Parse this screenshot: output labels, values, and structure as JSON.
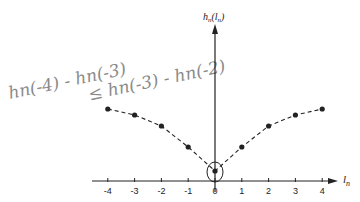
{
  "annotation": {
    "line1": "hn(-4) - hn(-3)",
    "line2": "≤ hn(-3) - hn(-2)",
    "color": "#8a8a8a"
  },
  "axes": {
    "y_label_main": "h",
    "y_label_sub": "n",
    "y_label_arg": "(l",
    "y_label_arg_sub": "n",
    "y_label_close": ")",
    "x_label_main": "l",
    "x_label_sub": "n"
  },
  "chart_data": {
    "type": "line",
    "title": "",
    "xlabel": "l_n",
    "ylabel": "h_n(l_n)",
    "x": [
      -4,
      -3,
      -2,
      -1,
      0,
      1,
      2,
      3,
      4
    ],
    "series": [
      {
        "name": "h_n(l_n)",
        "values": [
          0.72,
          0.66,
          0.55,
          0.34,
          0.1,
          0.34,
          0.55,
          0.66,
          0.72
        ],
        "style": "dashed with markers"
      }
    ],
    "tick_labels": [
      "-4",
      "-3",
      "-2",
      "-1",
      "0",
      "1",
      "2",
      "3",
      "4"
    ],
    "grid": false,
    "legend": "none",
    "annotations": [
      "circle around point at l_n = 0",
      "handwritten: hn(-4)-hn(-3) ≤ hn(-3)-hn(-2)"
    ]
  }
}
